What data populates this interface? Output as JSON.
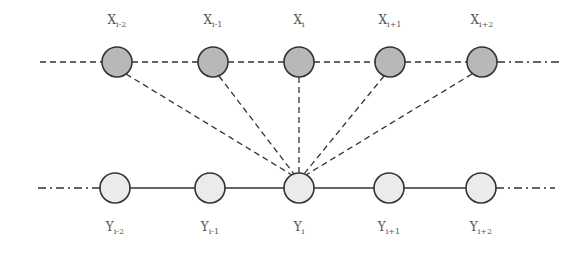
{
  "diagram": {
    "top_row": {
      "nodes": [
        {
          "label": "X",
          "sub": "i-2",
          "x": 117
        },
        {
          "label": "X",
          "sub": "i-1",
          "x": 213
        },
        {
          "label": "X",
          "sub": "i",
          "x": 299
        },
        {
          "label": "X",
          "sub": "i+1",
          "x": 390
        },
        {
          "label": "X",
          "sub": "i+2",
          "x": 482
        }
      ],
      "y": 62,
      "fill": "#b8b8b8"
    },
    "bottom_row": {
      "nodes": [
        {
          "label": "Y",
          "sub": "i-2",
          "x": 115
        },
        {
          "label": "Y",
          "sub": "i-1",
          "x": 210
        },
        {
          "label": "Y",
          "sub": "i",
          "x": 299
        },
        {
          "label": "Y",
          "sub": "i+1",
          "x": 389
        },
        {
          "label": "Y",
          "sub": "i+2",
          "x": 481
        }
      ],
      "y": 188,
      "fill": "#ebebeb"
    },
    "edges": "All X nodes connect to Y_i via dashed lines; Y nodes connected by solid line; X row connected by dashed line"
  }
}
